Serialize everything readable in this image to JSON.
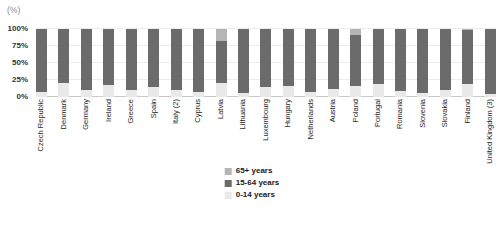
{
  "unit_label": "(%)",
  "y_ticks": [
    {
      "label": "0%",
      "value": 0
    },
    {
      "label": "25%",
      "value": 25
    },
    {
      "label": "50%",
      "value": 50
    },
    {
      "label": "75%",
      "value": 75
    },
    {
      "label": "100%",
      "value": 100
    }
  ],
  "legend": [
    {
      "label": "65+ years",
      "color": "#b5b5b5"
    },
    {
      "label": "15-64 years",
      "color": "#6b6b6b"
    },
    {
      "label": "0-14 years",
      "color": "#e9e9e9"
    }
  ],
  "colors": {
    "gridline": "#ececec",
    "axis_line": "#c9c9c9",
    "background": "#ffffff"
  },
  "chart_data": {
    "type": "bar",
    "stacked": true,
    "title": "",
    "xlabel": "",
    "ylabel": "(%)",
    "ylim": [
      0,
      100
    ],
    "grid": true,
    "legend_position": "bottom-center",
    "categories": [
      "Czech Republic",
      "Denmark",
      "Germany",
      "Ireland",
      "Greece",
      "Spain",
      "Italy (2)",
      "Cyprus",
      "Latvia",
      "Lithuania",
      "Luxembourg",
      "Hungary",
      "Netherlands",
      "Austria",
      "Poland",
      "Portugal",
      "Romania",
      "Slovenia",
      "Slovakia",
      "Finland",
      "United Kingdom (3)"
    ],
    "series": [
      {
        "name": "0-14 years",
        "color": "#e9e9e9",
        "values": [
          7,
          21,
          11,
          17,
          11,
          15,
          11,
          8,
          21,
          6,
          14,
          16,
          8,
          12,
          16,
          19,
          9,
          6,
          10,
          19,
          4
        ]
      },
      {
        "name": "15-64 years",
        "color": "#6b6b6b",
        "values": [
          93,
          79,
          89,
          83,
          89,
          85,
          89,
          92,
          62,
          94,
          86,
          84,
          92,
          88,
          75,
          81,
          91,
          94,
          90,
          79,
          96
        ]
      },
      {
        "name": "65+ years",
        "color": "#b5b5b5",
        "values": [
          0,
          0,
          0,
          0,
          0,
          0,
          0,
          0,
          17,
          0,
          0,
          0,
          0,
          0,
          9,
          0,
          0,
          0,
          0,
          2,
          0
        ]
      }
    ]
  }
}
